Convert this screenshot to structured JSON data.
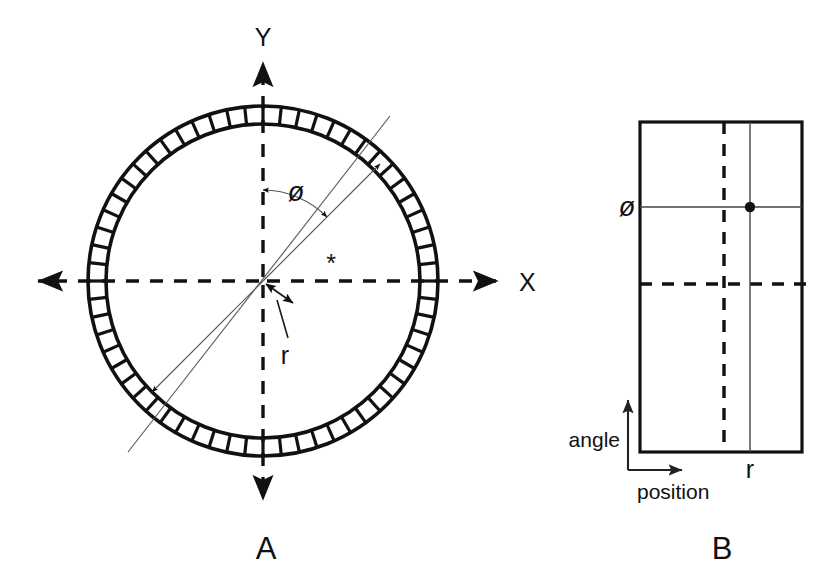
{
  "figure": {
    "background_color": "#ffffff",
    "line_color": "#111111",
    "thin_line_color": "#555555"
  },
  "panel_a": {
    "label": "A",
    "description": "Annular ring cross-section with segmented outer wall, X-Y axes through center, radial ray at angle phi, offset distance r, and an asterisk marker",
    "axis_x_label": "X",
    "axis_y_label": "Y",
    "angle_label": "ø",
    "radius_label": "r",
    "marker_label": "*",
    "center": {
      "x": 263,
      "y": 281
    },
    "ring": {
      "outer_radius": 175,
      "inner_radius": 157,
      "segment_count": 60
    },
    "ray_angle_degrees": 45
  },
  "panel_b": {
    "label": "B",
    "description": "Unrolled rectangular map with angle on vertical axis and position on horizontal axis",
    "axis_vertical_label": "angle",
    "axis_horizontal_label": "position",
    "angle_label": "ø",
    "radius_label": "r",
    "rect": {
      "left": 640,
      "top": 122,
      "right": 802,
      "bottom": 452
    },
    "dashed_vertical_x": 724,
    "dashed_horizontal_y": 284,
    "solid_vertical_x": 750,
    "solid_horizontal_y": 207,
    "point": {
      "x": 750,
      "y": 207
    }
  }
}
